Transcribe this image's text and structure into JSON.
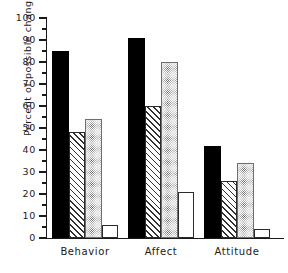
{
  "chart_data": {
    "type": "bar",
    "title": "",
    "xlabel": "",
    "ylabel": "Percent of possible change",
    "ylim": [
      0,
      100
    ],
    "ytick_step": 10,
    "yminor_step": 5,
    "grid": false,
    "legend": "none",
    "categories": [
      "Behavior",
      "Affect",
      "Attitude"
    ],
    "yticks": [
      "0",
      "10",
      "20",
      "30",
      "40",
      "50",
      "60",
      "70",
      "80",
      "90",
      "100"
    ],
    "series": [
      {
        "name": "series-1",
        "fill": "solid",
        "values": [
          85,
          91,
          42
        ]
      },
      {
        "name": "series-2",
        "fill": "hatch",
        "values": [
          48,
          60,
          26
        ]
      },
      {
        "name": "series-3",
        "fill": "dotted",
        "values": [
          54,
          80,
          34
        ]
      },
      {
        "name": "series-4",
        "fill": "open",
        "values": [
          6,
          21,
          4
        ]
      }
    ],
    "colors": {
      "axis": "#1a1a1a",
      "solid": "#000000",
      "hatch_line": "#2f2f2f",
      "dot": "#555555",
      "open": "#ffffff",
      "background": "#ffffff"
    }
  }
}
